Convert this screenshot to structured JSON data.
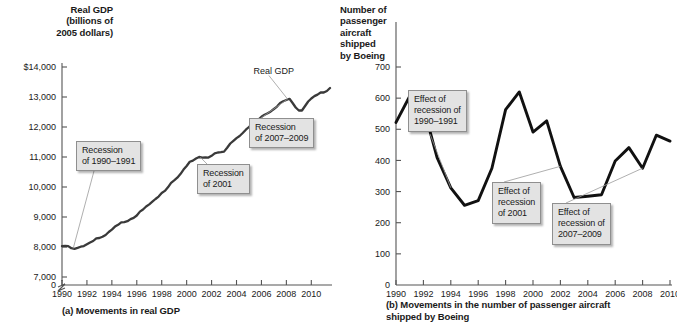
{
  "figure": {
    "panels": [
      {
        "id": "a",
        "axis_title": "Real GDP\n(billions of\n2005 dollars)",
        "caption": "(a) Movements in real GDP",
        "series_label": "Real GDP",
        "callouts": [
          {
            "text": "Recession\nof 1990–1991"
          },
          {
            "text": "Recession\nof 2001"
          },
          {
            "text": "Recession\nof 2007–2009"
          }
        ]
      },
      {
        "id": "b",
        "axis_title": "Number of\npassenger\naircraft\nshipped\nby Boeing",
        "caption": "(b) Movements in the number of passenger aircraft\nshipped by Boeing",
        "callouts": [
          {
            "text": "Effect of\nrecession of\n1990–1991"
          },
          {
            "text": "Effect of\nrecession\nof 2001"
          },
          {
            "text": "Effect of\nrecession of\n2007–2009"
          }
        ]
      }
    ]
  },
  "chart_data": [
    {
      "type": "line",
      "panel": "a",
      "title": "Movements in real GDP",
      "xlabel": "",
      "ylabel": "Real GDP (billions of 2005 dollars)",
      "series_name": "Real GDP",
      "grid": false,
      "legend": "none",
      "axis_break_below": 7000,
      "ylim": [
        7000,
        14000
      ],
      "xlim": [
        1990,
        2011.5
      ],
      "yticks": [
        0,
        7000,
        8000,
        9000,
        10000,
        11000,
        12000,
        13000,
        14000
      ],
      "ytick_labels": [
        "0",
        "7,000",
        "8,000",
        "9,000",
        "10,000",
        "11,000",
        "12,000",
        "13,000",
        "$14,000"
      ],
      "xticks": [
        1990,
        1992,
        1994,
        1996,
        1998,
        2000,
        2002,
        2004,
        2006,
        2008,
        2010
      ],
      "xtick_labels": [
        "1990",
        "1992",
        "1994",
        "1996",
        "1998",
        "2000",
        "2002",
        "2004",
        "2006",
        "2008",
        "2010"
      ],
      "x": [
        1990.0,
        1990.25,
        1990.5,
        1990.75,
        1991.0,
        1991.25,
        1991.5,
        1991.75,
        1992.0,
        1992.25,
        1992.5,
        1992.75,
        1993.0,
        1993.25,
        1993.5,
        1993.75,
        1994.0,
        1994.25,
        1994.5,
        1994.75,
        1995.0,
        1995.25,
        1995.5,
        1995.75,
        1996.0,
        1996.25,
        1996.5,
        1996.75,
        1997.0,
        1997.25,
        1997.5,
        1997.75,
        1998.0,
        1998.25,
        1998.5,
        1998.75,
        1999.0,
        1999.25,
        1999.5,
        1999.75,
        2000.0,
        2000.25,
        2000.5,
        2000.75,
        2001.0,
        2001.25,
        2001.5,
        2001.75,
        2002.0,
        2002.25,
        2002.5,
        2002.75,
        2003.0,
        2003.25,
        2003.5,
        2003.75,
        2004.0,
        2004.25,
        2004.5,
        2004.75,
        2005.0,
        2005.25,
        2005.5,
        2005.75,
        2006.0,
        2006.25,
        2006.5,
        2006.75,
        2007.0,
        2007.25,
        2007.5,
        2007.75,
        2008.0,
        2008.25,
        2008.5,
        2008.75,
        2009.0,
        2009.25,
        2009.5,
        2009.75,
        2010.0,
        2010.25,
        2010.5,
        2010.75,
        2011.0,
        2011.25,
        2011.5
      ],
      "y": [
        8030,
        8040,
        8030,
        7960,
        7940,
        7970,
        8010,
        8030,
        8090,
        8150,
        8200,
        8290,
        8300,
        8340,
        8400,
        8500,
        8580,
        8680,
        8740,
        8820,
        8830,
        8860,
        8930,
        8970,
        9050,
        9180,
        9250,
        9350,
        9420,
        9510,
        9600,
        9680,
        9800,
        9870,
        9990,
        10140,
        10220,
        10310,
        10430,
        10580,
        10700,
        10840,
        10880,
        10950,
        11000,
        10980,
        10990,
        10980,
        11040,
        11120,
        11150,
        11160,
        11180,
        11310,
        11450,
        11540,
        11630,
        11700,
        11800,
        11910,
        12000,
        12080,
        12200,
        12250,
        12340,
        12410,
        12460,
        12520,
        12600,
        12680,
        12800,
        12860,
        12900,
        12940,
        12800,
        12650,
        12550,
        12550,
        12700,
        12850,
        12950,
        13030,
        13080,
        13150,
        13150,
        13200,
        13300
      ],
      "annotations": [
        {
          "text": "Real GDP",
          "x": 2007.2,
          "y": 13850
        },
        {
          "text": "Recession of 1990–1991",
          "points_to": {
            "x": 1990.9,
            "y": 7950
          }
        },
        {
          "text": "Recession of 2001",
          "points_to": {
            "x": 2001.1,
            "y": 10990
          }
        },
        {
          "text": "Recession of 2007–2009",
          "points_to": {
            "x": 2008.1,
            "y": 12930
          }
        }
      ]
    },
    {
      "type": "line",
      "panel": "b",
      "title": "Movements in the number of passenger aircraft shipped by Boeing",
      "xlabel": "",
      "ylabel": "Number of passenger aircraft shipped by Boeing",
      "grid": false,
      "legend": "none",
      "ylim": [
        0,
        700
      ],
      "xlim": [
        1990,
        2010
      ],
      "yticks": [
        0,
        100,
        200,
        300,
        400,
        500,
        600,
        700
      ],
      "ytick_labels": [
        "0",
        "100",
        "200",
        "300",
        "400",
        "500",
        "600",
        "700"
      ],
      "xticks": [
        1990,
        1992,
        1994,
        1996,
        1998,
        2000,
        2002,
        2004,
        2006,
        2008,
        2010
      ],
      "xtick_labels": [
        "1990",
        "1992",
        "1994",
        "1996",
        "1998",
        "2000",
        "2002",
        "2004",
        "2006",
        "2008",
        "2010"
      ],
      "categories": [
        1990,
        1991,
        1992,
        1993,
        1994,
        1995,
        1996,
        1997,
        1998,
        1999,
        2000,
        2001,
        2002,
        2003,
        2004,
        2005,
        2006,
        2007,
        2008,
        2009,
        2010
      ],
      "values": [
        522,
        606,
        572,
        409,
        312,
        256,
        271,
        375,
        563,
        620,
        491,
        527,
        381,
        281,
        285,
        290,
        398,
        441,
        375,
        481,
        462
      ],
      "annotations": [
        {
          "text": "Effect of recession of 1990–1991",
          "points_to": {
            "x": 1994,
            "y": 312
          }
        },
        {
          "text": "Effect of recession of 2001",
          "points_to": {
            "x": 2002,
            "y": 381
          }
        },
        {
          "text": "Effect of recession of 2007–2009",
          "points_to": {
            "x": 2008,
            "y": 375
          }
        }
      ]
    }
  ]
}
